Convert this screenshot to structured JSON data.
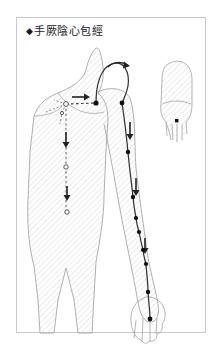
{
  "document": {
    "title_marker": "◆",
    "title": "手厥陰心包經",
    "title_full": "◆手厥陰心包經",
    "subject": "Pericardium Meridian of Hand-Jueyin",
    "frame": {
      "x": 16,
      "y": 17,
      "width": 190,
      "height": 316
    }
  },
  "colors": {
    "background": "#ffffff",
    "frame_border": "#c9c9c9",
    "title_text": "#1a1a1a",
    "body_outline": "#9a9a9a",
    "hatch_line": "#e4e4e4",
    "meridian_line": "#333333",
    "internal_branch": "#555555",
    "point_fill": "#111111",
    "hollow_point_stroke": "#555555",
    "arrow_fill": "#222222"
  },
  "figure": {
    "name": "anterior-body-torso-and-arm",
    "hatch_angle_deg": 45,
    "hatch_spacing_px": 4
  },
  "inset": {
    "name": "hand-dorsum-inset",
    "x": 160,
    "y": 62,
    "width": 40,
    "height": 75,
    "terminal_point_label": "middle-fingertip-point"
  },
  "meridian": {
    "code": "PC",
    "name": "手厥陰心包經",
    "flow_direction": "chest-to-hand",
    "external_path_points": [
      {
        "id": "pc1",
        "x": 96,
        "y": 103,
        "type": "filled"
      },
      {
        "id": "pc2",
        "x": 122,
        "y": 103,
        "type": "filled"
      },
      {
        "id": "pc3",
        "x": 128,
        "y": 152,
        "type": "filled"
      },
      {
        "id": "pc4",
        "x": 133,
        "y": 197,
        "type": "filled"
      },
      {
        "id": "pc5",
        "x": 136,
        "y": 218,
        "type": "filled"
      },
      {
        "id": "pc6",
        "x": 139,
        "y": 232,
        "type": "filled"
      },
      {
        "id": "pc7",
        "x": 143,
        "y": 250,
        "type": "filled"
      },
      {
        "id": "pc8",
        "x": 146,
        "y": 264,
        "type": "filled"
      },
      {
        "id": "pc9",
        "x": 148,
        "y": 292,
        "type": "filled"
      },
      {
        "id": "pc10",
        "x": 150,
        "y": 319,
        "type": "filled"
      }
    ],
    "internal_branch_points": [
      {
        "id": "b1",
        "x": 66,
        "y": 104,
        "type": "hollow"
      },
      {
        "id": "b2",
        "x": 62,
        "y": 113,
        "type": "hollow"
      },
      {
        "id": "b3",
        "x": 66,
        "y": 167,
        "type": "hollow"
      },
      {
        "id": "b4",
        "x": 67,
        "y": 212,
        "type": "hollow"
      }
    ],
    "arrows": [
      {
        "id": "a1",
        "x": 80,
        "y": 97,
        "dir": "right",
        "kind": "straight"
      },
      {
        "id": "a2",
        "x": 118,
        "y": 66,
        "dir": "clockwise",
        "kind": "curved"
      },
      {
        "id": "a3",
        "x": 130,
        "y": 130,
        "dir": "down",
        "kind": "straight"
      },
      {
        "id": "a4",
        "x": 136,
        "y": 186,
        "dir": "down",
        "kind": "straight"
      },
      {
        "id": "a5",
        "x": 143,
        "y": 244,
        "dir": "down",
        "kind": "straight"
      },
      {
        "id": "a6",
        "x": 66,
        "y": 140,
        "dir": "down",
        "kind": "straight"
      },
      {
        "id": "a7",
        "x": 67,
        "y": 193,
        "dir": "down",
        "kind": "straight"
      }
    ]
  }
}
